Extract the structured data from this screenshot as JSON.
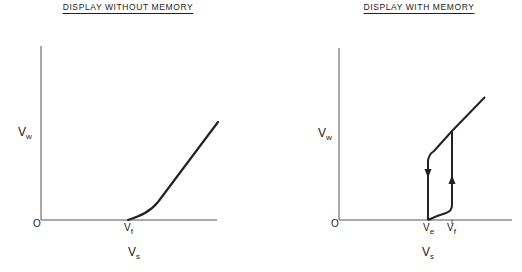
{
  "panels": [
    {
      "title": "DISPLAY WITHOUT MEMORY",
      "y_axis": {
        "label": "V",
        "subscript": "w"
      },
      "x_axis": {
        "label": "V",
        "subscript": "s"
      },
      "origin": "O",
      "ticks": [
        {
          "label": "V",
          "subscript": "f"
        }
      ]
    },
    {
      "title": "DISPLAY WITH MEMORY",
      "y_axis": {
        "label": "V",
        "subscript": "w"
      },
      "x_axis": {
        "label": "V",
        "subscript": "s"
      },
      "origin": "O",
      "ticks": [
        {
          "label": "V",
          "subscript": "e"
        },
        {
          "label": "V",
          "subscript": "f"
        }
      ]
    }
  ],
  "colors": {
    "line": "#222222",
    "axis": "#555555",
    "background": "#ffffff"
  }
}
